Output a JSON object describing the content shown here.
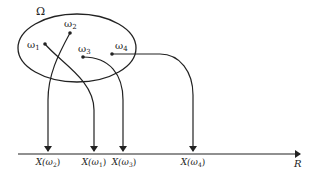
{
  "diagram": {
    "set_label": "Ω",
    "points": [
      {
        "name": "ω",
        "sub": "1"
      },
      {
        "name": "ω",
        "sub": "2"
      },
      {
        "name": "ω",
        "sub": "3"
      },
      {
        "name": "ω",
        "sub": "4"
      }
    ],
    "axis": {
      "label": "R",
      "ticks": [
        {
          "fn": "X(ω",
          "sub": "2",
          "close": ")"
        },
        {
          "fn": "X(ω",
          "sub": "1",
          "close": ")"
        },
        {
          "fn": "X(ω",
          "sub": "3",
          "close": ")"
        },
        {
          "fn": "X(ω",
          "sub": "4",
          "close": ")"
        }
      ]
    },
    "colors": {
      "stroke": "#222222",
      "background": "#ffffff"
    }
  }
}
